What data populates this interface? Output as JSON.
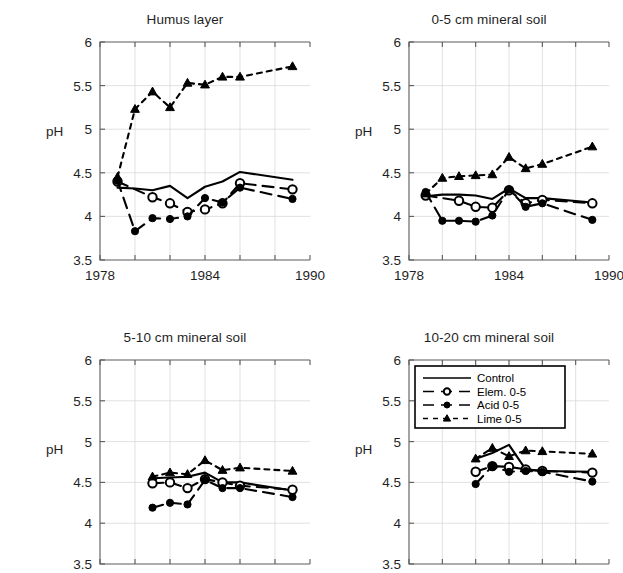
{
  "figure": {
    "ylabel": "pH",
    "series_names": [
      "Control",
      "Elem. 0-5",
      "Acid 0-5",
      "Lime 0-5"
    ]
  },
  "legend": {
    "position": "top-left of 10-20 cm mineral soil panel",
    "entries": [
      {
        "label": "Control",
        "style": "solid",
        "marker": "none"
      },
      {
        "label": "Elem. 0-5",
        "style": "long-dash",
        "marker": "open-circle"
      },
      {
        "label": "Acid 0-5",
        "style": "long-dash",
        "marker": "filled-circle"
      },
      {
        "label": "Lime 0-5",
        "style": "short-dash",
        "marker": "filled-triangle"
      }
    ]
  },
  "chart_data": [
    {
      "type": "line",
      "title": "Humus layer",
      "xlabel": "",
      "ylabel": "pH",
      "xlim": [
        1978,
        1990
      ],
      "ylim": [
        3.5,
        6
      ],
      "yticks": [
        3.5,
        4,
        4.5,
        5,
        5.5,
        6
      ],
      "ytick_labels": [
        "3.5",
        "4",
        "4.5",
        "5",
        "5.5",
        "6"
      ],
      "xticks": [
        1978,
        1980,
        1982,
        1984,
        1986,
        1988,
        1990
      ],
      "xtick_labels": [
        "1978",
        "",
        "",
        "1984",
        "",
        "",
        "1990"
      ],
      "xtick_labels_visible": true,
      "grid": true,
      "series": [
        {
          "name": "Control",
          "style": "solid",
          "marker": "none",
          "x": [
            1979,
            1980,
            1981,
            1982,
            1983,
            1984,
            1985,
            1986,
            1989
          ],
          "values": [
            4.33,
            4.32,
            4.3,
            4.35,
            4.21,
            4.34,
            4.4,
            4.51,
            4.42
          ]
        },
        {
          "name": "Elem. 0-5",
          "style": "long-dash",
          "marker": "open-circle",
          "x": [
            1979,
            1981,
            1982,
            1983,
            1984,
            1985,
            1986,
            1989
          ],
          "values": [
            4.4,
            4.22,
            4.15,
            4.05,
            4.08,
            4.15,
            4.38,
            4.31
          ]
        },
        {
          "name": "Acid 0-5",
          "style": "long-dash",
          "marker": "filled-circle",
          "x": [
            1979,
            1980,
            1981,
            1982,
            1983,
            1984,
            1985,
            1986,
            1989
          ],
          "values": [
            4.41,
            3.83,
            3.98,
            3.97,
            4.0,
            4.21,
            4.16,
            4.33,
            4.2
          ]
        },
        {
          "name": "Lime 0-5",
          "style": "short-dash",
          "marker": "filled-triangle",
          "x": [
            1979,
            1980,
            1981,
            1982,
            1983,
            1984,
            1985,
            1986,
            1989
          ],
          "values": [
            4.45,
            5.23,
            5.43,
            5.25,
            5.53,
            5.51,
            5.6,
            5.6,
            5.72
          ]
        }
      ]
    },
    {
      "type": "line",
      "title": "0-5 cm mineral soil",
      "xlabel": "",
      "ylabel": "pH",
      "xlim": [
        1978,
        1990
      ],
      "ylim": [
        3.5,
        6
      ],
      "yticks": [
        3.5,
        4,
        4.5,
        5,
        5.5,
        6
      ],
      "ytick_labels": [
        "3.5",
        "4",
        "4.5",
        "5",
        "5.5",
        "6"
      ],
      "xticks": [
        1978,
        1980,
        1982,
        1984,
        1986,
        1988,
        1990
      ],
      "xtick_labels": [
        "1978",
        "",
        "",
        "1984",
        "",
        "",
        "1990"
      ],
      "xtick_labels_visible": true,
      "grid": true,
      "series": [
        {
          "name": "Control",
          "style": "solid",
          "marker": "none",
          "x": [
            1979,
            1980,
            1981,
            1982,
            1983,
            1984,
            1985,
            1986,
            1989
          ],
          "values": [
            4.23,
            4.25,
            4.25,
            4.24,
            4.2,
            4.32,
            4.21,
            4.21,
            4.16
          ]
        },
        {
          "name": "Elem. 0-5",
          "style": "long-dash",
          "marker": "open-circle",
          "x": [
            1979,
            1981,
            1982,
            1983,
            1984,
            1985,
            1986,
            1989
          ],
          "values": [
            4.24,
            4.18,
            4.11,
            4.1,
            4.3,
            4.15,
            4.19,
            4.15
          ]
        },
        {
          "name": "Acid 0-5",
          "style": "long-dash",
          "marker": "filled-circle",
          "x": [
            1979,
            1980,
            1981,
            1982,
            1983,
            1984,
            1985,
            1986,
            1989
          ],
          "values": [
            4.28,
            3.95,
            3.95,
            3.94,
            4.01,
            4.31,
            4.11,
            4.15,
            3.96
          ]
        },
        {
          "name": "Lime 0-5",
          "style": "short-dash",
          "marker": "filled-triangle",
          "x": [
            1979,
            1980,
            1981,
            1982,
            1983,
            1984,
            1985,
            1986,
            1989
          ],
          "values": [
            4.26,
            4.44,
            4.46,
            4.47,
            4.48,
            4.68,
            4.55,
            4.6,
            4.8
          ]
        }
      ]
    },
    {
      "type": "line",
      "title": "5-10 cm mineral soil",
      "xlabel": "",
      "ylabel": "pH",
      "xlim": [
        1978,
        1990
      ],
      "ylim": [
        3.5,
        6
      ],
      "yticks": [
        3.5,
        4,
        4.5,
        5,
        5.5,
        6
      ],
      "ytick_labels": [
        "3.5",
        "4",
        "4.5",
        "5",
        "5.5",
        "6"
      ],
      "xticks": [
        1978,
        1980,
        1982,
        1984,
        1986,
        1988,
        1990
      ],
      "xtick_labels": [
        "",
        "",
        "",
        "",
        "",
        "",
        ""
      ],
      "xtick_labels_visible": false,
      "grid": true,
      "series": [
        {
          "name": "Control",
          "style": "solid",
          "marker": "none",
          "x": [
            1981,
            1982,
            1983,
            1984,
            1985,
            1986,
            1989
          ],
          "values": [
            4.55,
            4.56,
            4.57,
            4.62,
            4.5,
            4.5,
            4.4
          ]
        },
        {
          "name": "Elem. 0-5",
          "style": "long-dash",
          "marker": "open-circle",
          "x": [
            1981,
            1982,
            1983,
            1984,
            1985,
            1986,
            1989
          ],
          "values": [
            4.49,
            4.5,
            4.43,
            4.54,
            4.5,
            4.46,
            4.41
          ]
        },
        {
          "name": "Acid 0-5",
          "style": "long-dash",
          "marker": "filled-circle",
          "x": [
            1981,
            1982,
            1983,
            1984,
            1985,
            1986,
            1989
          ],
          "values": [
            4.19,
            4.25,
            4.23,
            4.53,
            4.43,
            4.43,
            4.32
          ]
        },
        {
          "name": "Lime 0-5",
          "style": "short-dash",
          "marker": "filled-triangle",
          "x": [
            1981,
            1982,
            1983,
            1984,
            1985,
            1986,
            1989
          ],
          "values": [
            4.57,
            4.62,
            4.6,
            4.77,
            4.65,
            4.68,
            4.64
          ]
        }
      ]
    },
    {
      "type": "line",
      "title": "10-20 cm mineral soil",
      "xlabel": "",
      "ylabel": "pH",
      "xlim": [
        1978,
        1990
      ],
      "ylim": [
        3.5,
        6
      ],
      "yticks": [
        3.5,
        4,
        4.5,
        5,
        5.5,
        6
      ],
      "ytick_labels": [
        "3.5",
        "4",
        "4.5",
        "5",
        "5.5",
        "6"
      ],
      "xticks": [
        1978,
        1980,
        1982,
        1984,
        1986,
        1988,
        1990
      ],
      "xtick_labels": [
        "",
        "",
        "",
        "",
        "",
        "",
        ""
      ],
      "xtick_labels_visible": false,
      "grid": true,
      "series": [
        {
          "name": "Control",
          "style": "solid",
          "marker": "none",
          "x": [
            1982,
            1983,
            1984,
            1985,
            1986,
            1989
          ],
          "values": [
            4.79,
            4.86,
            4.96,
            4.66,
            4.64,
            4.63
          ]
        },
        {
          "name": "Elem. 0-5",
          "style": "long-dash",
          "marker": "open-circle",
          "x": [
            1982,
            1983,
            1984,
            1985,
            1986,
            1989
          ],
          "values": [
            4.63,
            4.7,
            4.69,
            4.66,
            4.64,
            4.62
          ]
        },
        {
          "name": "Acid 0-5",
          "style": "long-dash",
          "marker": "filled-circle",
          "x": [
            1982,
            1983,
            1984,
            1985,
            1986,
            1989
          ],
          "values": [
            4.48,
            4.7,
            4.63,
            4.64,
            4.63,
            4.51
          ]
        },
        {
          "name": "Lime 0-5",
          "style": "short-dash",
          "marker": "filled-triangle",
          "x": [
            1982,
            1983,
            1984,
            1985,
            1986,
            1989
          ],
          "values": [
            4.79,
            4.92,
            4.82,
            4.89,
            4.88,
            4.85
          ]
        }
      ]
    }
  ]
}
